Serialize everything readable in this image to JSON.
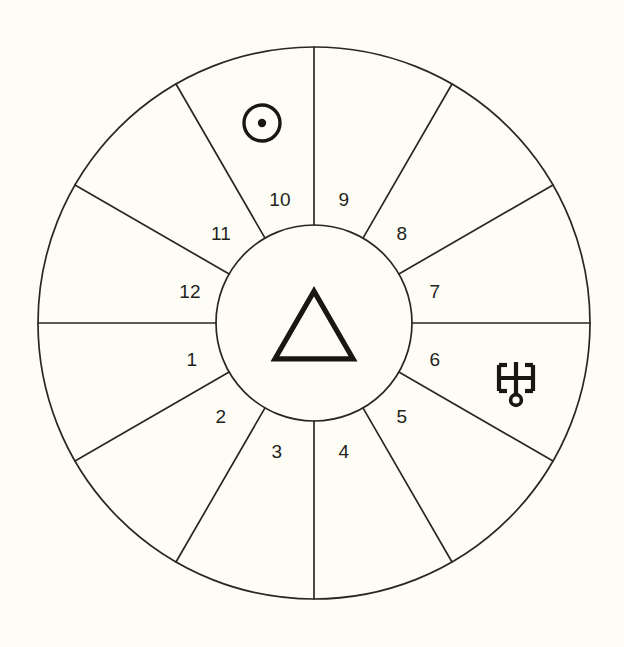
{
  "chart": {
    "background_color": "#fdfdf6",
    "line_color": "#2a2722",
    "glyph_color": "#1a1712"
  },
  "geometry": {
    "center_x": 314,
    "center_y": 323,
    "outer_radius": 276,
    "inner_radius": 98
  },
  "houses": [
    {
      "number": "1",
      "label_x": 192,
      "label_y": 361
    },
    {
      "number": "2",
      "label_x": 221,
      "label_y": 418
    },
    {
      "number": "3",
      "label_x": 277,
      "label_y": 453
    },
    {
      "number": "4",
      "label_x": 344,
      "label_y": 453
    },
    {
      "number": "5",
      "label_x": 402,
      "label_y": 418
    },
    {
      "number": "6",
      "label_x": 435,
      "label_y": 361
    },
    {
      "number": "7",
      "label_x": 435,
      "label_y": 293
    },
    {
      "number": "8",
      "label_x": 402,
      "label_y": 235
    },
    {
      "number": "9",
      "label_x": 344,
      "label_y": 201
    },
    {
      "number": "10",
      "label_x": 280,
      "label_y": 201
    },
    {
      "number": "11",
      "label_x": 221,
      "label_y": 235
    },
    {
      "number": "12",
      "label_x": 190,
      "label_y": 293
    }
  ],
  "spokes": {
    "count": 12,
    "start_angle_deg": 90,
    "step_deg": 30
  },
  "center_symbol": {
    "name": "fire-triangle",
    "glyph": "triangle",
    "cx": 314,
    "cy": 325,
    "size": 78
  },
  "planets": [
    {
      "name": "sun-symbol",
      "glyph": "circle-with-dot",
      "cx": 262,
      "cy": 123,
      "radius": 18,
      "dot_radius": 4.2,
      "house": "10"
    },
    {
      "name": "uranus-symbol",
      "glyph": "uranus",
      "cx": 516,
      "cy": 378,
      "house": "6"
    }
  ],
  "chart_data": {
    "type": "pie",
    "categories": [
      "1",
      "2",
      "3",
      "4",
      "5",
      "6",
      "7",
      "8",
      "9",
      "10",
      "11",
      "12"
    ],
    "values": [
      30,
      30,
      30,
      30,
      30,
      30,
      30,
      30,
      30,
      30,
      30,
      30
    ],
    "xlabel": "",
    "ylabel": "",
    "legend_position": "none",
    "grid": false,
    "annotations": [
      {
        "text": "Sun",
        "symbol": "circle-with-dot",
        "at_house": "10"
      },
      {
        "text": "Uranus",
        "symbol": "uranus",
        "at_house": "6"
      },
      {
        "text": "Fire",
        "symbol": "triangle",
        "at_house": "center"
      }
    ]
  }
}
